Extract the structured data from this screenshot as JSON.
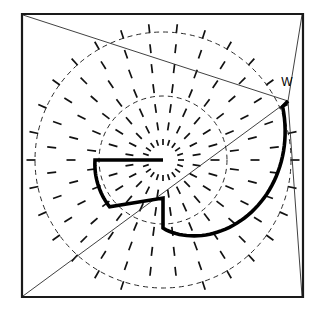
{
  "figure": {
    "type": "vector-field-spiral-diagram",
    "canvas": {
      "width": 326,
      "height": 319,
      "background": "#ffffff"
    },
    "center": {
      "x": 163,
      "y": 160
    },
    "colors": {
      "ink": "#000000",
      "frame": "#1a1a1a",
      "dashed": "#2b2b2b",
      "thin": "#2b2b2b",
      "background": "#ffffff"
    },
    "frame": {
      "name": "square-border",
      "corners": [
        {
          "x": 22,
          "y": 14
        },
        {
          "x": 303,
          "y": 14
        },
        {
          "x": 303,
          "y": 297
        },
        {
          "x": 22,
          "y": 297
        }
      ],
      "stroke_width": 2.2
    },
    "dashed_circles": [
      {
        "name": "outer-dashed-circle",
        "cx": 163,
        "cy": 160,
        "r": 128,
        "dash": "5 4"
      },
      {
        "name": "inner-dashed-circle",
        "cx": 163,
        "cy": 160,
        "r": 64,
        "dash": "5 4"
      }
    ],
    "point_w": {
      "label": "W",
      "label_x": 287,
      "label_y": 86,
      "anchor_x": 288,
      "anchor_y": 101
    },
    "thin_lines": [
      {
        "name": "diagonal-topleft-to-w",
        "x1": 23,
        "y1": 15,
        "x2": 288,
        "y2": 101
      },
      {
        "name": "diagonal-bottomleft-to-w",
        "x1": 23,
        "y1": 296,
        "x2": 288,
        "y2": 101
      },
      {
        "name": "edge-topright-to-w",
        "x1": 302,
        "y1": 15,
        "x2": 288,
        "y2": 101
      },
      {
        "name": "edge-w-to-bottomright",
        "x1": 288,
        "y1": 101,
        "x2": 302,
        "y2": 296
      }
    ],
    "spiral": {
      "name": "thick-spiral-curve",
      "description": "Heavy two-turn spiral arm running from inner horizontal stub outward to point W",
      "stroke_width": 3.6,
      "turns": 2,
      "inner_stub": {
        "x1": 163,
        "y1": 160,
        "x2": 95,
        "y2": 160
      },
      "outer_end": {
        "x": 288,
        "y": 101
      }
    },
    "field": {
      "name": "radial-direction-field",
      "description": "Short radial tick marks arranged on concentric rings around the center",
      "tick_length": 9,
      "rings": [
        {
          "radius": 18,
          "count": 20,
          "tick_len": 6
        },
        {
          "radius": 34,
          "count": 20,
          "tick_len": 8
        },
        {
          "radius": 52,
          "count": 22,
          "tick_len": 9
        },
        {
          "radius": 72,
          "count": 24,
          "tick_len": 9
        },
        {
          "radius": 92,
          "count": 26,
          "tick_len": 9
        },
        {
          "radius": 112,
          "count": 28,
          "tick_len": 9
        },
        {
          "radius": 132,
          "count": 30,
          "tick_len": 9
        }
      ]
    }
  },
  "chart_data": {
    "type": "scatter",
    "xlabel": "",
    "ylabel": "",
    "annotations": [
      {
        "text": "W",
        "x": 287,
        "y": 86
      }
    ],
    "legend": [],
    "grid": false
  }
}
